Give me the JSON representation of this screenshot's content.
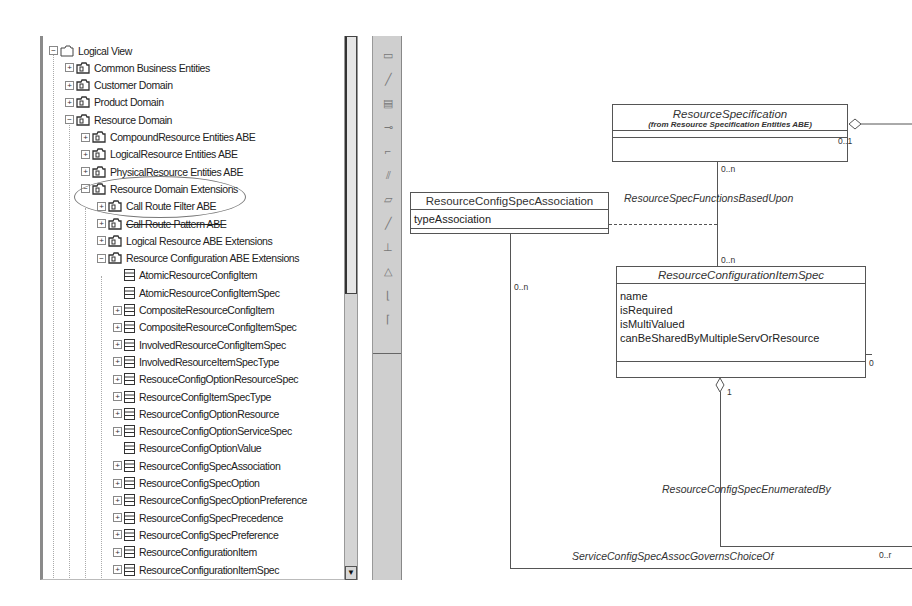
{
  "tree": {
    "items": [
      {
        "label": "Logical View",
        "level": 0,
        "expander": "minus",
        "icon": "folder-icon"
      },
      {
        "label": "Common Business Entities",
        "level": 1,
        "expander": "plus",
        "icon": "package-folder-icon"
      },
      {
        "label": "Customer Domain",
        "level": 1,
        "expander": "plus",
        "icon": "package-folder-icon"
      },
      {
        "label": "Product Domain",
        "level": 1,
        "expander": "plus",
        "icon": "package-folder-icon"
      },
      {
        "label": "Resource Domain",
        "level": 1,
        "expander": "minus",
        "icon": "package-folder-icon"
      },
      {
        "label": "CompoundResource Entities ABE",
        "level": 2,
        "expander": "plus",
        "icon": "package-folder-icon"
      },
      {
        "label": "LogicalResource Entities ABE",
        "level": 2,
        "expander": "plus",
        "icon": "package-folder-icon"
      },
      {
        "label": "PhysicalResource Entities ABE",
        "level": 2,
        "expander": "plus",
        "icon": "package-folder-icon"
      },
      {
        "label": "Resource Domain Extensions",
        "level": 2,
        "expander": "minus",
        "icon": "package-folder-icon"
      },
      {
        "label": "Call Route Filter ABE",
        "level": 3,
        "expander": "plus",
        "icon": "package-folder-icon"
      },
      {
        "label": "Call Route Pattern ABE",
        "level": 3,
        "expander": "plus",
        "icon": "package-folder-icon"
      },
      {
        "label": "Logical Resource ABE Extensions",
        "level": 3,
        "expander": "plus",
        "icon": "package-folder-icon"
      },
      {
        "label": "Resource Configuration ABE Extensions",
        "level": 3,
        "expander": "minus",
        "icon": "package-folder-icon"
      },
      {
        "label": "AtomicResourceConfigItem",
        "level": 4,
        "expander": "none",
        "icon": "class-icon"
      },
      {
        "label": "AtomicResourceConfigItemSpec",
        "level": 4,
        "expander": "none",
        "icon": "class-icon"
      },
      {
        "label": "CompositeResourceConfigItem",
        "level": 4,
        "expander": "plus",
        "icon": "class-icon"
      },
      {
        "label": "CompositeResourceConfigItemSpec",
        "level": 4,
        "expander": "plus",
        "icon": "class-icon"
      },
      {
        "label": "InvolvedResourceConfigItemSpec",
        "level": 4,
        "expander": "plus",
        "icon": "class-icon"
      },
      {
        "label": "InvolvedResourceItemSpecType",
        "level": 4,
        "expander": "plus",
        "icon": "class-icon"
      },
      {
        "label": "ResouceConfigOptionResourceSpec",
        "level": 4,
        "expander": "plus",
        "icon": "class-icon"
      },
      {
        "label": "ResourceConfigItemSpecType",
        "level": 4,
        "expander": "plus",
        "icon": "class-icon"
      },
      {
        "label": "ResourceConfigOptionResource",
        "level": 4,
        "expander": "plus",
        "icon": "class-icon"
      },
      {
        "label": "ResourceConfigOptionServiceSpec",
        "level": 4,
        "expander": "plus",
        "icon": "class-icon"
      },
      {
        "label": "ResourceConfigOptionValue",
        "level": 4,
        "expander": "none",
        "icon": "class-icon"
      },
      {
        "label": "ResourceConfigSpecAssociation",
        "level": 4,
        "expander": "plus",
        "icon": "class-icon"
      },
      {
        "label": "ResourceConfigSpecOption",
        "level": 4,
        "expander": "plus",
        "icon": "class-icon"
      },
      {
        "label": "ResourceConfigSpecOptionPreference",
        "level": 4,
        "expander": "plus",
        "icon": "class-icon"
      },
      {
        "label": "ResourceConfigSpecPrecedence",
        "level": 4,
        "expander": "plus",
        "icon": "class-icon"
      },
      {
        "label": "ResourceConfigSpecPreference",
        "level": 4,
        "expander": "plus",
        "icon": "class-icon"
      },
      {
        "label": "ResourceConfigurationItem",
        "level": 4,
        "expander": "plus",
        "icon": "class-icon"
      },
      {
        "label": "ResourceConfigurationItemSpec",
        "level": 4,
        "expander": "plus",
        "icon": "class-icon"
      }
    ],
    "expander_glyphs": {
      "plus": "+",
      "minus": "−",
      "none": ""
    },
    "scroll_down_glyph": "▼"
  },
  "toolbar": {
    "tools": [
      {
        "name": "text-box-tool",
        "glyph": "▭"
      },
      {
        "name": "note-anchor-tool",
        "glyph": "╱"
      },
      {
        "name": "class-tool",
        "glyph": "▤"
      },
      {
        "name": "interface-tool",
        "glyph": "⊸"
      },
      {
        "name": "unidirectional-association-tool",
        "glyph": "⌐"
      },
      {
        "name": "dependency-tool",
        "glyph": "⫽"
      },
      {
        "name": "package-tool",
        "glyph": "▱"
      },
      {
        "name": "association-tool",
        "glyph": "╱"
      },
      {
        "name": "realize-tool",
        "glyph": "⊥"
      },
      {
        "name": "generalization-tool",
        "glyph": "△"
      },
      {
        "name": "aggregation-tool",
        "glyph": "⌊"
      },
      {
        "name": "composition-tool",
        "glyph": "⌈"
      }
    ]
  },
  "diagram": {
    "classes": {
      "resource_specification": {
        "name": "ResourceSpecification",
        "from": "(from Resource Specification Entities ABE)"
      },
      "resource_config_spec_association": {
        "name": "ResourceConfigSpecAssociation",
        "attributes": [
          "typeAssociation"
        ]
      },
      "resource_configuration_item_spec": {
        "name": "ResourceConfigurationItemSpec",
        "attributes": [
          "name",
          "isRequired",
          "isMultiValued",
          "canBeSharedByMultipleServOrResource"
        ]
      }
    },
    "associations": {
      "spec_functions_based_upon": "ResourceSpecFunctionsBasedUpon",
      "enumerated_by": "ResourceConfigSpecEnumeratedBy",
      "governs_choice_of": "ServiceConfigSpecAssocGovernsChoiceOf"
    },
    "multiplicities": {
      "spec_right": "0..1",
      "spec_bottom": "0..n",
      "item_spec_top": "0..n",
      "assoc_bottom": "0..n",
      "item_spec_right": "0",
      "item_spec_bottom": "1",
      "governs_right": "0..r"
    }
  }
}
